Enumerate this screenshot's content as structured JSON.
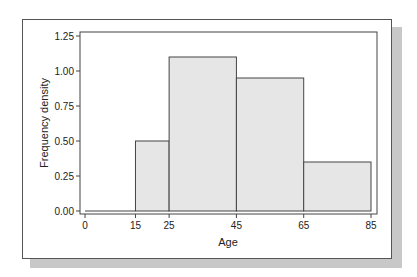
{
  "chart_data": {
    "type": "bar",
    "subtype": "histogram",
    "title": "",
    "xlabel": "Age",
    "ylabel": "Frequency density",
    "bins": [
      {
        "from": 0,
        "to": 15,
        "value": 0.0
      },
      {
        "from": 15,
        "to": 25,
        "value": 0.5
      },
      {
        "from": 25,
        "to": 45,
        "value": 1.1
      },
      {
        "from": 45,
        "to": 65,
        "value": 0.95
      },
      {
        "from": 65,
        "to": 85,
        "value": 0.35
      }
    ],
    "categories": [
      "0-15",
      "15-25",
      "25-45",
      "45-65",
      "65-85"
    ],
    "values": [
      0.0,
      0.5,
      1.1,
      0.95,
      0.35
    ],
    "xticks": [
      "0",
      "15",
      "25",
      "45",
      "65",
      "85"
    ],
    "yticks": [
      "0.00",
      "0.25",
      "0.50",
      "0.75",
      "1.00",
      "1.25"
    ],
    "xlim": [
      0,
      85
    ],
    "ylim": [
      0,
      1.25
    ],
    "grid": false,
    "legend": null,
    "colors": {
      "bar_fill": "#e6e6e6",
      "bar_edge": "#444444",
      "axis": "#444444",
      "frame_shadow": "#c8c8c8"
    }
  }
}
